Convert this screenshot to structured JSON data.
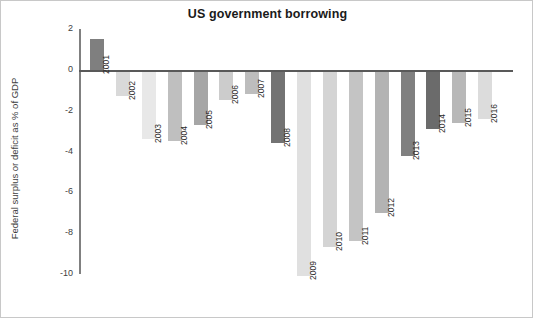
{
  "chart_data": {
    "type": "bar",
    "title": "US government borrowing",
    "xlabel": "",
    "ylabel": "Federal surplus or deficit as % of GDP",
    "ylim": [
      -10,
      2
    ],
    "yticks": [
      "2",
      "0",
      "-2",
      "-4",
      "-6",
      "-8",
      "-10"
    ],
    "ytick_values": [
      2,
      0,
      -2,
      -4,
      -6,
      -8,
      -10
    ],
    "grid": false,
    "legend": null,
    "categories": [
      "2001",
      "2002",
      "2003",
      "2004",
      "2005",
      "2006",
      "2007",
      "2008",
      "2009",
      "2010",
      "2011",
      "2012",
      "2013",
      "2014",
      "2015",
      "2016"
    ],
    "values": [
      1.5,
      -1.2,
      -3.3,
      -3.4,
      -2.6,
      -1.4,
      -1.1,
      -3.5,
      -10.0,
      -8.6,
      -8.3,
      -6.9,
      -4.1,
      -2.8,
      -2.5,
      -2.3
    ],
    "bar_colors": [
      "#7f7f7f",
      "#d9d9d9",
      "#e8e8e8",
      "#bfbfbf",
      "#a6a6a6",
      "#cccccc",
      "#bdbdbd",
      "#737373",
      "#e0e0e0",
      "#d4d4d4",
      "#c4c4c4",
      "#b3b3b3",
      "#808080",
      "#6b6b6b",
      "#b8b8b8",
      "#dcdcdc"
    ],
    "axis_color": "#595959",
    "spine_color": "#808080",
    "text_color": "#404040",
    "title_color": "#1a1a1a",
    "background": "#ffffff"
  }
}
